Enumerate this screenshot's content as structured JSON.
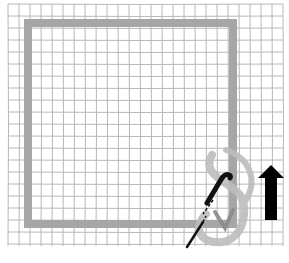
{
  "diagram": {
    "type": "stitch-illustration",
    "colors": {
      "background": "#ffffff",
      "grid": "#b8b8b8",
      "outline": "#a6a6a6",
      "thread_loop": "#bdbdbd",
      "needle": "#111111",
      "arrow": "#000000"
    },
    "grid": {
      "x_start": 8,
      "x_end": 283,
      "y_start": 4,
      "y_end": 246,
      "step_x": 11,
      "step_y": 12
    },
    "square": {
      "x": 28,
      "y": 23,
      "width": 205,
      "height": 201,
      "stroke_width": 8
    },
    "arrow": {
      "direction": "up",
      "x": 258,
      "y": 165,
      "width": 26,
      "height": 57
    },
    "labels": []
  }
}
